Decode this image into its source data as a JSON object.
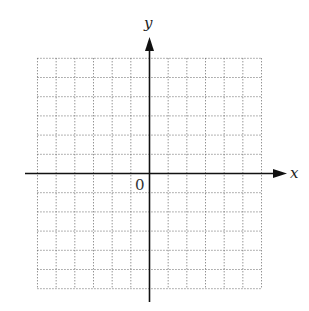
{
  "diagram": {
    "type": "coordinate-plane",
    "x_axis_label": "x",
    "y_axis_label": "y",
    "origin_label": "0",
    "grid": {
      "columns": 12,
      "rows": 12,
      "style": "dotted",
      "x_cells_left_of_origin": 6,
      "x_cells_right_of_origin": 6,
      "y_cells_above_origin": 6,
      "y_cells_below_origin": 6
    },
    "colors": {
      "axis": "#111111",
      "grid": "#555555",
      "background": "#ffffff"
    }
  }
}
